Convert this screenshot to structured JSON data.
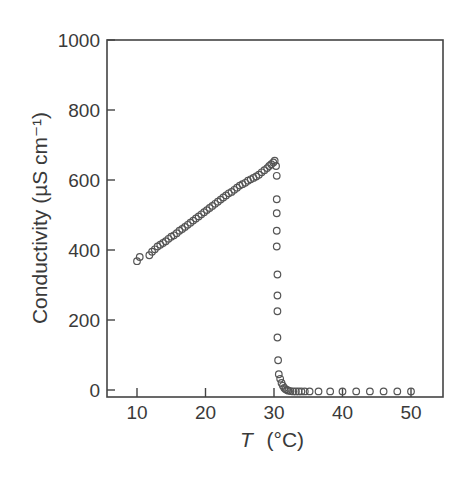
{
  "chart_data": {
    "type": "scatter",
    "title": "",
    "xlabel": "T (°C)",
    "xlabel_italic": "T",
    "xlabel_unit": "(°C)",
    "ylabel": "Conductivity (µS cm⁻¹)",
    "xlim": [
      5.5,
      54.5
    ],
    "ylim": [
      -20,
      1000
    ],
    "xticks": [
      10,
      20,
      30,
      40,
      50
    ],
    "yticks": [
      0,
      200,
      400,
      600,
      800,
      1000
    ],
    "grid": false,
    "legend": null,
    "marker": "open-circle",
    "series": [
      {
        "name": "Conductivity",
        "x": [
          10.0,
          10.4,
          11.8,
          12.2,
          12.6,
          13.0,
          13.4,
          13.8,
          14.2,
          14.6,
          15.0,
          15.4,
          15.8,
          16.2,
          16.6,
          17.0,
          17.4,
          17.8,
          18.2,
          18.6,
          19.0,
          19.4,
          19.8,
          20.2,
          20.6,
          21.0,
          21.4,
          21.8,
          22.2,
          22.6,
          23.0,
          23.4,
          23.8,
          24.2,
          24.6,
          25.0,
          25.4,
          25.8,
          26.2,
          26.6,
          27.0,
          27.4,
          27.8,
          28.2,
          28.6,
          29.0,
          29.3,
          29.6,
          29.9,
          30.1,
          30.3,
          30.4,
          30.4,
          30.4,
          30.4,
          30.4,
          30.5,
          30.5,
          30.5,
          30.5,
          30.6,
          30.7,
          30.9,
          31.1,
          31.3,
          31.5,
          31.7,
          31.9,
          32.1,
          32.4,
          32.8,
          33.2,
          33.6,
          34.0,
          34.5,
          35.2,
          36.5,
          38.2,
          40.0,
          42.0,
          44.0,
          46.0,
          48.0,
          50.0
        ],
        "y": [
          368,
          380,
          385,
          395,
          402,
          410,
          415,
          420,
          425,
          432,
          438,
          442,
          448,
          455,
          460,
          466,
          472,
          478,
          484,
          490,
          496,
          502,
          508,
          514,
          520,
          526,
          532,
          538,
          544,
          550,
          556,
          562,
          566,
          572,
          578,
          584,
          588,
          592,
          598,
          602,
          606,
          610,
          615,
          622,
          628,
          634,
          640,
          645,
          650,
          655,
          640,
          612,
          545,
          505,
          455,
          410,
          330,
          270,
          225,
          150,
          85,
          45,
          32,
          20,
          12,
          6,
          2,
          0,
          -2,
          -3,
          -4,
          -4,
          -4,
          -4,
          -4,
          -4,
          -4,
          -4,
          -4,
          -4,
          -4,
          -4,
          -4,
          -4
        ]
      }
    ]
  }
}
